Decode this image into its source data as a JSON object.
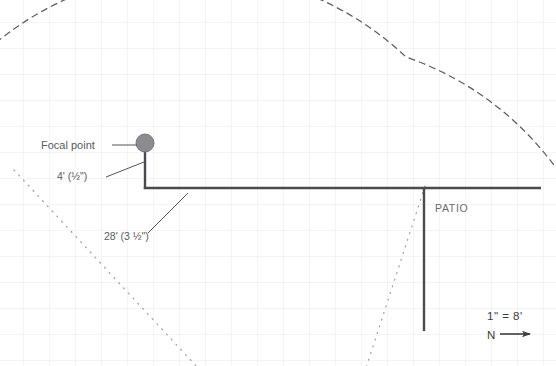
{
  "drawing": {
    "type": "architectural-site-plan",
    "background": "#ffffff",
    "grid": {
      "color": "#e9e9ec",
      "spacing_px": 26,
      "origin_x": 23,
      "origin_y": 22,
      "visible": true
    },
    "colors": {
      "wall": "#4a4a4f",
      "leader": "#55555a",
      "text": "#5a5a5f",
      "focal_fill": "#8c8c90",
      "focal_stroke": "#76767a",
      "arc": "#5e5e63",
      "dotted": "#9a9aa0",
      "grid": "#e9e9ec"
    }
  },
  "labels": {
    "focal_point": "Focal point",
    "dim_short": "4' (½\")",
    "dim_long": "28' (3 ½\")",
    "patio": "PATIO",
    "scale": "1\" = 8'",
    "north": "N"
  },
  "elements": {
    "focal_point_marker": {
      "name": "focal-point-marker",
      "cx": 145,
      "cy": 143,
      "r": 9
    },
    "arc": {
      "name": "sight-arc",
      "style": "dashed",
      "center_x": 145,
      "center_y": 143,
      "radius": 310,
      "note": "dashed viewing radius arc centered on focal point"
    },
    "wall_vertical_house": {
      "x": 145,
      "y1": 143,
      "y2": 188
    },
    "wall_horizontal": {
      "y": 188,
      "x1": 145,
      "x2": 541
    },
    "wall_vertical_patio": {
      "x": 424,
      "y1": 188,
      "y2": 331
    },
    "dotted_left": {
      "name": "sight-line-left",
      "x1": 16,
      "y1": 172,
      "x2": 196,
      "y2": 366
    },
    "dotted_right": {
      "name": "sight-line-right",
      "x1": 424,
      "y1": 188,
      "x2": 368,
      "y2": 366
    },
    "north_arrow": {
      "x1": 500,
      "y1": 334,
      "x2": 534,
      "y2": 334
    }
  },
  "label_positions": {
    "focal_point": {
      "x": 41,
      "y": 149,
      "leader_x1": 113,
      "leader_y1": 145,
      "leader_x2": 137,
      "leader_y2": 145
    },
    "dim_short": {
      "x": 57,
      "y": 180,
      "leader_x1": 106,
      "leader_y1": 177,
      "leader_x2": 144,
      "leader_y2": 163
    },
    "dim_long": {
      "x": 104,
      "y": 240,
      "leader_x1": 148,
      "leader_y1": 232,
      "leader_x2": 186,
      "leader_y2": 194
    },
    "patio": {
      "x": 435,
      "y": 212
    },
    "scale": {
      "x": 487,
      "y": 320
    },
    "north": {
      "x": 487,
      "y": 339
    }
  }
}
